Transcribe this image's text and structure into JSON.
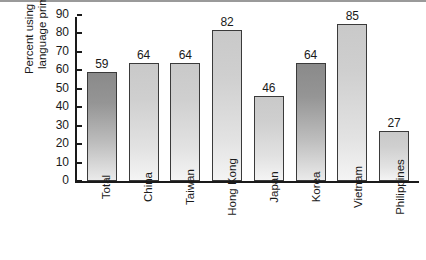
{
  "chart_data": {
    "type": "bar",
    "title": "",
    "xlabel": "",
    "ylabel_lines": [
      "Percent using native",
      "language primarily"
    ],
    "ylabel": "Percent using native language primarily",
    "categories": [
      "Total",
      "China",
      "Taiwan",
      "Hong Kong",
      "Japan",
      "Korea",
      "Vietnam",
      "Philippines"
    ],
    "values": [
      59,
      64,
      64,
      82,
      46,
      64,
      85,
      27
    ],
    "value_labels": [
      "59",
      "64",
      "64",
      "82",
      "46",
      "64",
      "85",
      "27"
    ],
    "bar_styles": [
      "dark",
      "light",
      "light",
      "light",
      "light",
      "dark",
      "light",
      "light"
    ],
    "ylim": [
      0,
      90
    ],
    "ytick_values": [
      90,
      80,
      70,
      60,
      50,
      40,
      30,
      20,
      10,
      0
    ],
    "ytick_labels": [
      "90",
      "80",
      "70",
      "60",
      "50",
      "40",
      "30",
      "20",
      "10",
      "0"
    ],
    "grid": false,
    "legend": null,
    "colors": {
      "bar_light_top": "#c9c9c9",
      "bar_light_bottom": "#f4f4f4",
      "bar_dark_top": "#8a8a8a",
      "bar_dark_bottom": "#eaeaea",
      "bar_edge": "#3a3a3a",
      "axis": "#1a1a1a",
      "text": "#1a1a1a",
      "background": "#ffffff",
      "top_rule": "#9a9a9a"
    }
  }
}
